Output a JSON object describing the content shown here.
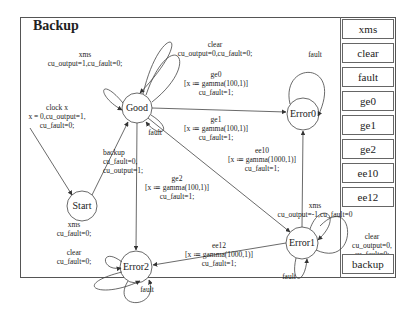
{
  "title": "Backup",
  "states": [
    {
      "id": "good",
      "label": "Good"
    },
    {
      "id": "start",
      "label": "Start"
    },
    {
      "id": "error0",
      "label": "Error0"
    },
    {
      "id": "error1",
      "label": "Error1"
    },
    {
      "id": "error2",
      "label": "Error2"
    }
  ],
  "transitions": {
    "good_xms": [
      "xms",
      "cu_output=1,cu_fault=0;"
    ],
    "good_clear": [
      "clear",
      "cu_output=0,cu_fault=0;"
    ],
    "good_fault": [
      "fault"
    ],
    "clock": [
      "clock x",
      "x = 0,cu_output=1,",
      "cu_fault=0;"
    ],
    "backup": [
      "backup",
      "cu_fault=0,",
      "cu_output=1;"
    ],
    "ge0": [
      "ge0",
      "[x ≔ gamma(100,1)]",
      "cu_fault=1;"
    ],
    "ge1": [
      "ge1",
      "[x ≔ gamma(100,1)]",
      "cu_fault=1;"
    ],
    "ee10": [
      "ee10",
      "[x ≔ gamma(1000,1)]",
      "cu_fault=1;"
    ],
    "ge2": [
      "ge2",
      "[x ≔ gamma(100,1)]",
      "cu_fault=1;"
    ],
    "ee12": [
      "ee12",
      "[x ≔ gamma(1000,1)]",
      "cu_fault=1;"
    ],
    "error0_fault": [
      "fault"
    ],
    "error1_xms": [
      "xms",
      "cu_output=-1,cu_fault=0"
    ],
    "error1_clear": [
      "clear",
      "cu_output=0,",
      "cu_fault=0;"
    ],
    "error1_fault": [
      "fault"
    ],
    "error2_xms": [
      "xms",
      "cu_fault=0;"
    ],
    "error2_clear": [
      "clear",
      "cu_fault=0;"
    ],
    "error2_fault": [
      "fault"
    ]
  },
  "side_buttons": [
    "xms",
    "clear",
    "fault",
    "ge0",
    "ge1",
    "ge2",
    "ee10",
    "ee12"
  ],
  "backup_button": "backup"
}
